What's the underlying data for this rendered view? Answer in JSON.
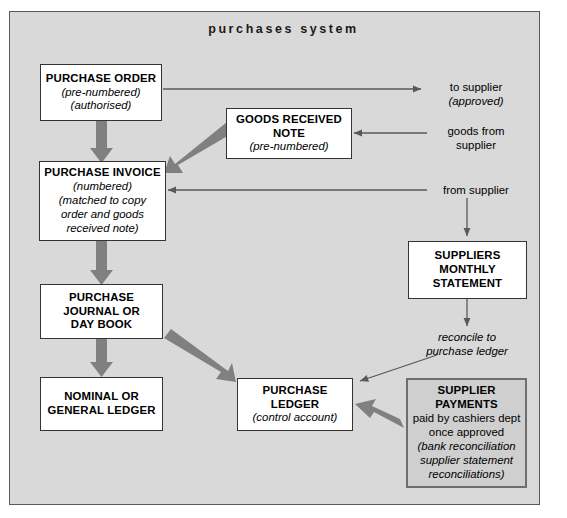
{
  "diagram": {
    "title": "purchases system",
    "frame_bg": "#d9d9d9",
    "thick_arrow_color": "#808080",
    "thin_arrow_color": "#595959",
    "boxes": {
      "purchase_order": {
        "line1": "PURCHASE ORDER",
        "line2": "(pre-numbered)",
        "line3": "(authorised)"
      },
      "goods_received_note": {
        "line1": "GOODS RECEIVED",
        "line2": "NOTE",
        "line3": "(pre-numbered)"
      },
      "purchase_invoice": {
        "line1": "PURCHASE INVOICE",
        "line2": "(numbered)",
        "line3": "(matched to copy",
        "line4": "order and goods",
        "line5": "received note)"
      },
      "suppliers_monthly_statement": {
        "line1": "SUPPLIERS",
        "line2": "MONTHLY",
        "line3": "STATEMENT"
      },
      "purchase_journal": {
        "line1": "PURCHASE",
        "line2": "JOURNAL OR",
        "line3": "DAY BOOK"
      },
      "nominal_ledger": {
        "line1": "NOMINAL OR",
        "line2": "GENERAL LEDGER"
      },
      "purchase_ledger": {
        "line1": "PURCHASE",
        "line2": "LEDGER",
        "line3": "(control account)"
      },
      "supplier_payments": {
        "line1": "SUPPLIER",
        "line2": "PAYMENTS",
        "line3": "paid by cashiers dept",
        "line4": "once approved",
        "line5": "(bank reconciliation",
        "line6": "supplier statement",
        "line7": "reconciliations)"
      }
    },
    "labels": {
      "to_supplier": {
        "line1": "to supplier",
        "line2": "(approved)"
      },
      "goods_from_supplier": {
        "line1": "goods from",
        "line2": "supplier"
      },
      "from_supplier": {
        "line1": "from supplier"
      },
      "reconcile": {
        "line1": "reconcile to",
        "line2": "purchase ledger"
      }
    }
  }
}
